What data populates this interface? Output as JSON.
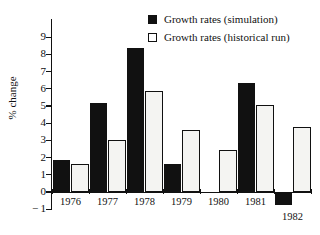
{
  "chart_data": {
    "type": "bar",
    "title": "",
    "xlabel": "",
    "ylabel": "% change",
    "categories": [
      "1976",
      "1977",
      "1978",
      "1979",
      "1980",
      "1981",
      "1982"
    ],
    "series": [
      {
        "name": "Growth rates (simulation)",
        "color": "#111111",
        "values": [
          1.85,
          5.15,
          8.4,
          1.65,
          null,
          6.35,
          -0.75
        ]
      },
      {
        "name": "Growth rates (historical run)",
        "color": "#f4f4f2",
        "values": [
          1.65,
          3.0,
          5.85,
          3.6,
          2.45,
          5.05,
          3.8
        ]
      }
    ],
    "ylim": [
      -1,
      9
    ],
    "yticks": [
      "9",
      "8",
      "7",
      "6",
      "5",
      "4",
      "3",
      "2",
      "1",
      "0",
      "-1"
    ],
    "ytick_values": [
      9,
      8,
      7,
      6,
      5,
      4,
      3,
      2,
      1,
      0,
      -1
    ],
    "grid": false,
    "legend_position": "top-right",
    "legend": [
      {
        "label": "Growth rates (simulation)",
        "marker": "filled-square"
      },
      {
        "label": "Growth rates (historical run)",
        "marker": "open-square"
      }
    ]
  }
}
